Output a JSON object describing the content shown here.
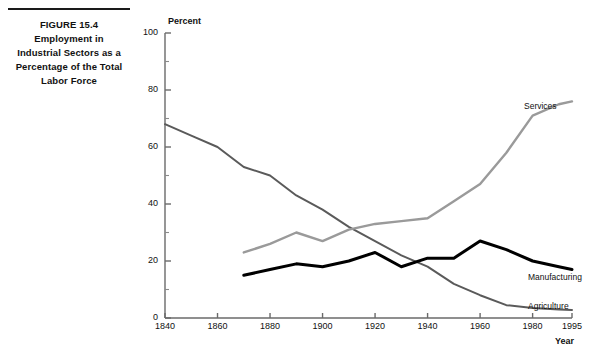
{
  "caption": {
    "rule": "horizontal-rule",
    "lines": [
      "FIGURE 15.4",
      "Employment in",
      "Industrial Sectors as a",
      "Percentage of the Total",
      "Labor Force"
    ]
  },
  "chart_data": {
    "type": "line",
    "title": "Employment in Industrial Sectors as a Percentage of the Total Labor Force",
    "subtitle": "FIGURE 15.4",
    "xlabel": "Year",
    "ylabel": "Percent",
    "xlim": [
      1840,
      1995
    ],
    "ylim": [
      0,
      100
    ],
    "grid": false,
    "legend": "inline-right-of-line-ends",
    "x_tick_labels": [
      "1840",
      "1860",
      "1880",
      "1900",
      "1920",
      "1940",
      "1960",
      "1980",
      "1995"
    ],
    "x_ticks": [
      1840,
      1860,
      1880,
      1900,
      1920,
      1940,
      1960,
      1980,
      1995
    ],
    "y_tick_labels": [
      "0",
      "20",
      "40",
      "60",
      "80",
      "100"
    ],
    "y_ticks": [
      0,
      20,
      40,
      60,
      80,
      100
    ],
    "y_minor_ticks": [
      10,
      30,
      50,
      70,
      90
    ],
    "series": [
      {
        "name": "Agriculture",
        "color": "#5a5a5a",
        "width": 2.0,
        "x": [
          1840,
          1850,
          1860,
          1870,
          1880,
          1890,
          1900,
          1910,
          1920,
          1930,
          1940,
          1950,
          1960,
          1970,
          1980,
          1990,
          1995
        ],
        "values": [
          68,
          64,
          60,
          53,
          50,
          43,
          38,
          32,
          27,
          22,
          18,
          12,
          8,
          4.5,
          3.5,
          3,
          2.8
        ]
      },
      {
        "name": "Manufacturing",
        "color": "#000000",
        "width": 3.0,
        "x": [
          1870,
          1880,
          1890,
          1900,
          1910,
          1920,
          1930,
          1940,
          1950,
          1960,
          1970,
          1980,
          1990,
          1995
        ],
        "values": [
          15,
          17,
          19,
          18,
          20,
          23,
          18,
          21,
          21,
          27,
          24,
          20,
          18,
          17
        ]
      },
      {
        "name": "Services",
        "color": "#9a9a9a",
        "width": 2.4,
        "x": [
          1870,
          1880,
          1890,
          1900,
          1910,
          1920,
          1930,
          1940,
          1950,
          1960,
          1970,
          1980,
          1990,
          1995
        ],
        "values": [
          23,
          26,
          30,
          27,
          31,
          33,
          34,
          35,
          41,
          47,
          58,
          71,
          75,
          76
        ]
      }
    ],
    "annotations": [
      {
        "label": "Services",
        "x_px": 524,
        "y_px": 101
      },
      {
        "label": "Manufacturing",
        "x_px": 528,
        "y_px": 272
      },
      {
        "label": "Agriculture",
        "x_px": 528,
        "y_px": 301
      }
    ]
  },
  "axis_unit_label": "Percent",
  "axis_x_title": "Year"
}
